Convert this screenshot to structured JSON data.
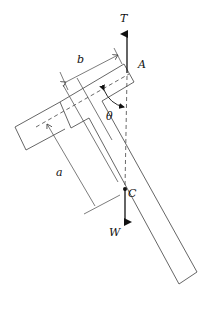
{
  "diagram": {
    "labels": {
      "tension": "T",
      "pivot": "A",
      "angle": "θ",
      "dim_b": "b",
      "dim_a": "a",
      "center": "C",
      "weight": "W"
    },
    "colors": {
      "stroke": "#555555",
      "arrow": "#111111",
      "background": "#ffffff"
    }
  }
}
